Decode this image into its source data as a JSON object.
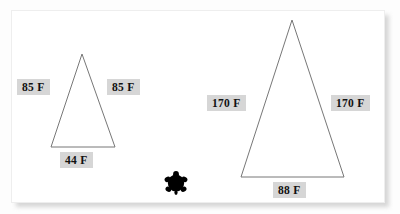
{
  "scene": {
    "description": "Two isosceles triangles with side and base measurement labels",
    "background_color": "#fdfdfd",
    "card_color": "#ffffff",
    "line_color": "#777777",
    "chip_background": "#d6d6d6",
    "chip_text_color": "#111111"
  },
  "figures": [
    {
      "id": "small-triangle",
      "name": "Small triangle",
      "labels": {
        "left_side": "85 F",
        "right_side": "85 F",
        "base": "44 F"
      },
      "geometry": {
        "apex_x": 82,
        "apex_y": 54,
        "base_left_x": 51,
        "base_right_x": 115,
        "base_y": 147
      }
    },
    {
      "id": "large-triangle",
      "name": "Large triangle",
      "labels": {
        "left_side": "170 F",
        "right_side": "170 F",
        "base": "88 F"
      },
      "geometry": {
        "apex_x": 292,
        "apex_y": 20,
        "base_left_x": 241,
        "base_right_x": 344,
        "base_y": 177
      }
    }
  ],
  "decorations": [
    {
      "id": "turtle",
      "icon": "turtle-icon",
      "color": "#000000"
    }
  ]
}
